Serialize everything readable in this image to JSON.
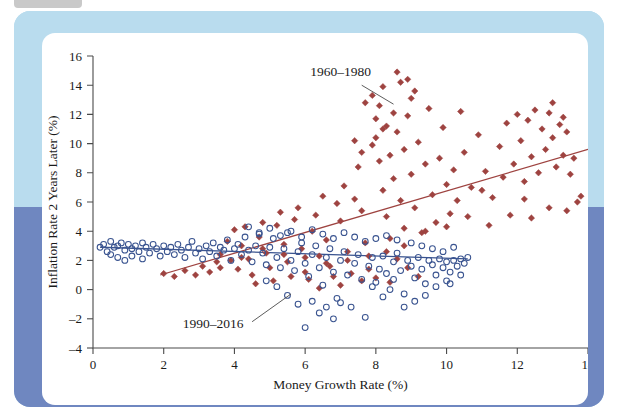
{
  "figure": {
    "frame_color_top": "#b9dcee",
    "frame_color_bottom": "#6f87c0",
    "card_color": "#ffffff"
  },
  "chart_data": {
    "type": "scatter",
    "title": "",
    "xlabel": "Money Growth Rate (%)",
    "ylabel": "Inflation Rate 2 Years Later (%)",
    "xlim": [
      0,
      14
    ],
    "ylim": [
      -4,
      16
    ],
    "xticks": [
      0,
      2,
      4,
      6,
      8,
      10,
      12,
      14
    ],
    "yticks": [
      -4,
      -2,
      0,
      2,
      4,
      6,
      8,
      10,
      12,
      14,
      16
    ],
    "grid": false,
    "legend": "annotations",
    "annotations": [
      {
        "text": "1960–1980",
        "text_x": 7.0,
        "text_y": 14.6,
        "leader_from": [
          7.6,
          14.0
        ],
        "leader_to": [
          8.5,
          12.7
        ]
      },
      {
        "text": "1990–2016",
        "text_x": 3.4,
        "text_y": -2.6,
        "leader_from": [
          4.5,
          -2.2
        ],
        "leader_to": [
          5.6,
          -0.3
        ]
      }
    ],
    "series": [
      {
        "name": "1960–1980",
        "marker": "diamond",
        "filled": true,
        "color": "#9e4340",
        "trendline": {
          "color": "#9e4340",
          "x0": 1.9,
          "y0": 1.0,
          "x1": 14.0,
          "y1": 9.6
        },
        "points": [
          [
            2.0,
            1.1
          ],
          [
            2.3,
            0.9
          ],
          [
            2.6,
            1.3
          ],
          [
            2.9,
            1.0
          ],
          [
            3.1,
            1.6
          ],
          [
            3.3,
            1.2
          ],
          [
            3.5,
            1.9
          ],
          [
            3.6,
            2.4
          ],
          [
            3.8,
            3.3
          ],
          [
            3.9,
            2.0
          ],
          [
            4.0,
            4.1
          ],
          [
            4.1,
            1.4
          ],
          [
            4.2,
            3.0
          ],
          [
            4.3,
            4.3
          ],
          [
            4.4,
            2.1
          ],
          [
            4.5,
            1.0
          ],
          [
            4.6,
            0.4
          ],
          [
            4.7,
            3.6
          ],
          [
            4.8,
            4.6
          ],
          [
            4.9,
            2.5
          ],
          [
            5.0,
            1.5
          ],
          [
            5.1,
            0.6
          ],
          [
            5.2,
            4.4
          ],
          [
            5.3,
            5.3
          ],
          [
            5.4,
            3.1
          ],
          [
            5.5,
            1.9
          ],
          [
            5.6,
            0.9
          ],
          [
            5.7,
            4.8
          ],
          [
            5.8,
            5.6
          ],
          [
            5.9,
            2.8
          ],
          [
            6.0,
            1.2
          ],
          [
            6.1,
            0.7
          ],
          [
            6.2,
            4.0
          ],
          [
            6.3,
            5.1
          ],
          [
            6.4,
            2.3
          ],
          [
            6.5,
            6.4
          ],
          [
            6.6,
            3.4
          ],
          [
            6.7,
            1.6
          ],
          [
            6.8,
            0.9
          ],
          [
            6.9,
            5.9
          ],
          [
            7.0,
            4.7
          ],
          [
            7.1,
            7.1
          ],
          [
            7.2,
            2.6
          ],
          [
            7.3,
            1.1
          ],
          [
            7.4,
            6.2
          ],
          [
            7.5,
            8.4
          ],
          [
            7.6,
            5.4
          ],
          [
            7.7,
            3.2
          ],
          [
            7.8,
            1.4
          ],
          [
            7.9,
            9.9
          ],
          [
            8.0,
            11.7
          ],
          [
            8.0,
            10.4
          ],
          [
            8.1,
            12.6
          ],
          [
            8.1,
            8.8
          ],
          [
            8.2,
            6.8
          ],
          [
            8.2,
            13.9
          ],
          [
            8.3,
            11.2
          ],
          [
            8.3,
            5.0
          ],
          [
            8.4,
            9.2
          ],
          [
            8.4,
            3.5
          ],
          [
            8.5,
            12.1
          ],
          [
            8.5,
            7.6
          ],
          [
            8.6,
            10.8
          ],
          [
            8.6,
            2.1
          ],
          [
            8.7,
            14.2
          ],
          [
            8.7,
            6.1
          ],
          [
            8.8,
            9.6
          ],
          [
            8.8,
            4.2
          ],
          [
            8.9,
            11.9
          ],
          [
            8.9,
            1.5
          ],
          [
            9.0,
            13.1
          ],
          [
            9.0,
            7.9
          ],
          [
            9.1,
            5.6
          ],
          [
            9.2,
            10.1
          ],
          [
            9.3,
            3.9
          ],
          [
            9.4,
            8.6
          ],
          [
            9.5,
            12.4
          ],
          [
            9.6,
            6.5
          ],
          [
            9.7,
            4.6
          ],
          [
            9.8,
            9.0
          ],
          [
            9.9,
            11.1
          ],
          [
            10.0,
            7.2
          ],
          [
            10.1,
            5.2
          ],
          [
            10.2,
            8.2
          ],
          [
            10.3,
            6.1
          ],
          [
            10.5,
            9.4
          ],
          [
            10.7,
            7.0
          ],
          [
            10.9,
            10.6
          ],
          [
            11.1,
            8.1
          ],
          [
            11.3,
            6.3
          ],
          [
            11.5,
            9.8
          ],
          [
            11.7,
            11.4
          ],
          [
            11.9,
            8.6
          ],
          [
            12.0,
            12.0
          ],
          [
            12.1,
            10.2
          ],
          [
            12.2,
            7.4
          ],
          [
            12.3,
            11.6
          ],
          [
            12.4,
            9.1
          ],
          [
            12.5,
            12.3
          ],
          [
            12.6,
            8.0
          ],
          [
            12.7,
            11.0
          ],
          [
            12.8,
            9.6
          ],
          [
            12.9,
            12.1
          ],
          [
            13.0,
            10.4
          ],
          [
            13.1,
            8.4
          ],
          [
            13.2,
            11.3
          ],
          [
            13.3,
            9.2
          ],
          [
            13.4,
            10.8
          ],
          [
            13.5,
            7.9
          ],
          [
            13.6,
            9.0
          ],
          [
            13.7,
            6.0
          ],
          [
            13.8,
            6.4
          ],
          [
            13.4,
            5.4
          ],
          [
            12.9,
            5.6
          ],
          [
            12.4,
            4.9
          ],
          [
            11.8,
            5.1
          ],
          [
            11.2,
            4.4
          ],
          [
            10.6,
            5.0
          ],
          [
            10.0,
            4.3
          ],
          [
            9.4,
            4.0
          ],
          [
            8.8,
            3.0
          ],
          [
            8.3,
            2.6
          ],
          [
            7.8,
            2.3
          ],
          [
            7.2,
            2.0
          ],
          [
            6.6,
            1.8
          ],
          [
            6.0,
            2.2
          ],
          [
            5.4,
            2.4
          ],
          [
            4.8,
            2.8
          ],
          [
            4.2,
            2.2
          ],
          [
            3.6,
            1.5
          ],
          [
            8.0,
            0.8
          ],
          [
            8.4,
            0.5
          ],
          [
            7.6,
            0.6
          ],
          [
            7.0,
            0.3
          ],
          [
            6.4,
            0.1
          ],
          [
            9.2,
            0.9
          ],
          [
            8.6,
            14.9
          ],
          [
            8.9,
            14.4
          ],
          [
            9.1,
            13.6
          ],
          [
            7.7,
            12.8
          ],
          [
            7.9,
            13.3
          ],
          [
            8.2,
            11.0
          ],
          [
            7.4,
            10.2
          ],
          [
            7.6,
            9.4
          ],
          [
            10.4,
            12.2
          ],
          [
            11.0,
            6.8
          ],
          [
            11.6,
            7.7
          ],
          [
            12.2,
            6.2
          ],
          [
            13.0,
            12.8
          ],
          [
            13.3,
            11.8
          ]
        ]
      },
      {
        "name": "1990–2016",
        "marker": "circle",
        "filled": false,
        "color": "#3a5490",
        "trendline": {
          "color": "#3a5490",
          "x0": 0.2,
          "y0": 2.9,
          "x1": 10.6,
          "y1": 2.1
        },
        "points": [
          [
            0.2,
            2.9
          ],
          [
            0.3,
            3.1
          ],
          [
            0.4,
            2.6
          ],
          [
            0.5,
            3.3
          ],
          [
            0.5,
            2.4
          ],
          [
            0.6,
            2.9
          ],
          [
            0.7,
            3.0
          ],
          [
            0.7,
            2.2
          ],
          [
            0.8,
            3.2
          ],
          [
            0.9,
            2.7
          ],
          [
            0.9,
            2.0
          ],
          [
            1.0,
            3.1
          ],
          [
            1.1,
            2.8
          ],
          [
            1.1,
            2.3
          ],
          [
            1.2,
            3.0
          ],
          [
            1.3,
            2.6
          ],
          [
            1.4,
            3.2
          ],
          [
            1.4,
            2.1
          ],
          [
            1.5,
            2.9
          ],
          [
            1.6,
            2.5
          ],
          [
            1.7,
            3.1
          ],
          [
            1.8,
            2.8
          ],
          [
            1.9,
            2.3
          ],
          [
            2.0,
            3.0
          ],
          [
            2.1,
            2.6
          ],
          [
            2.2,
            2.9
          ],
          [
            2.3,
            2.4
          ],
          [
            2.4,
            3.1
          ],
          [
            2.5,
            2.7
          ],
          [
            2.6,
            2.2
          ],
          [
            2.7,
            2.9
          ],
          [
            2.8,
            3.3
          ],
          [
            2.9,
            2.5
          ],
          [
            3.0,
            2.8
          ],
          [
            3.1,
            2.1
          ],
          [
            3.2,
            3.0
          ],
          [
            3.3,
            2.6
          ],
          [
            3.4,
            3.2
          ],
          [
            3.5,
            2.3
          ],
          [
            3.6,
            2.9
          ],
          [
            3.7,
            2.7
          ],
          [
            3.8,
            3.4
          ],
          [
            3.9,
            2.0
          ],
          [
            4.0,
            2.8
          ],
          [
            4.1,
            3.1
          ],
          [
            4.2,
            2.4
          ],
          [
            4.3,
            3.6
          ],
          [
            4.4,
            2.7
          ],
          [
            4.5,
            1.9
          ],
          [
            4.6,
            3.0
          ],
          [
            4.7,
            3.8
          ],
          [
            4.8,
            2.5
          ],
          [
            4.9,
            1.7
          ],
          [
            5.0,
            2.9
          ],
          [
            5.1,
            3.5
          ],
          [
            5.2,
            2.2
          ],
          [
            5.3,
            1.5
          ],
          [
            5.4,
            2.8
          ],
          [
            5.5,
            3.9
          ],
          [
            5.6,
            2.0
          ],
          [
            5.7,
            1.3
          ],
          [
            5.8,
            2.6
          ],
          [
            5.9,
            3.2
          ],
          [
            6.0,
            1.8
          ],
          [
            6.1,
            0.9
          ],
          [
            6.2,
            2.4
          ],
          [
            6.3,
            3.0
          ],
          [
            6.4,
            1.5
          ],
          [
            6.5,
            0.3
          ],
          [
            6.6,
            2.2
          ],
          [
            6.7,
            2.8
          ],
          [
            6.8,
            1.2
          ],
          [
            6.9,
            -0.6
          ],
          [
            7.0,
            2.0
          ],
          [
            7.1,
            2.6
          ],
          [
            7.2,
            1.0
          ],
          [
            7.3,
            -1.2
          ],
          [
            7.4,
            1.8
          ],
          [
            7.5,
            2.4
          ],
          [
            7.6,
            0.7
          ],
          [
            7.7,
            -1.9
          ],
          [
            7.8,
            1.6
          ],
          [
            7.9,
            2.2
          ],
          [
            8.0,
            0.5
          ],
          [
            8.1,
            1.4
          ],
          [
            8.2,
            2.3
          ],
          [
            8.3,
            1.1
          ],
          [
            8.4,
            0.0
          ],
          [
            8.5,
            1.9
          ],
          [
            8.6,
            2.5
          ],
          [
            8.7,
            1.3
          ],
          [
            8.8,
            -0.3
          ],
          [
            8.9,
            2.0
          ],
          [
            9.0,
            1.6
          ],
          [
            9.1,
            0.8
          ],
          [
            9.2,
            2.2
          ],
          [
            9.3,
            1.4
          ],
          [
            9.4,
            0.4
          ],
          [
            9.5,
            2.0
          ],
          [
            9.6,
            1.7
          ],
          [
            9.7,
            1.0
          ],
          [
            9.8,
            2.1
          ],
          [
            9.9,
            1.5
          ],
          [
            10.0,
            1.9
          ],
          [
            10.1,
            1.2
          ],
          [
            10.2,
            2.0
          ],
          [
            10.3,
            1.6
          ],
          [
            10.4,
            2.1
          ],
          [
            10.5,
            1.8
          ],
          [
            10.6,
            2.2
          ],
          [
            6.0,
            -2.6
          ],
          [
            6.4,
            -1.6
          ],
          [
            6.8,
            -2.0
          ],
          [
            5.8,
            -1.0
          ],
          [
            5.5,
            -0.4
          ],
          [
            6.2,
            -0.8
          ],
          [
            6.6,
            -1.2
          ],
          [
            7.0,
            -0.9
          ],
          [
            5.2,
            0.2
          ],
          [
            4.9,
            0.6
          ],
          [
            8.6,
            3.4
          ],
          [
            8.3,
            3.7
          ],
          [
            8.0,
            3.5
          ],
          [
            7.7,
            3.3
          ],
          [
            7.4,
            3.6
          ],
          [
            7.1,
            3.9
          ],
          [
            6.8,
            3.5
          ],
          [
            6.5,
            3.8
          ],
          [
            6.2,
            4.1
          ],
          [
            5.9,
            3.6
          ],
          [
            5.6,
            4.0
          ],
          [
            5.3,
            3.7
          ],
          [
            5.0,
            4.2
          ],
          [
            4.7,
            3.9
          ],
          [
            4.4,
            4.3
          ],
          [
            9.0,
            3.2
          ],
          [
            9.3,
            3.0
          ],
          [
            9.6,
            2.8
          ],
          [
            9.9,
            2.6
          ],
          [
            10.2,
            2.9
          ],
          [
            10.0,
            0.6
          ],
          [
            9.7,
            0.2
          ],
          [
            9.4,
            -0.4
          ],
          [
            9.1,
            -0.8
          ],
          [
            8.8,
            -1.2
          ],
          [
            8.5,
            0.7
          ],
          [
            8.2,
            -0.5
          ],
          [
            7.9,
            0.2
          ],
          [
            10.4,
            1.0
          ],
          [
            10.1,
            0.4
          ]
        ]
      }
    ]
  }
}
